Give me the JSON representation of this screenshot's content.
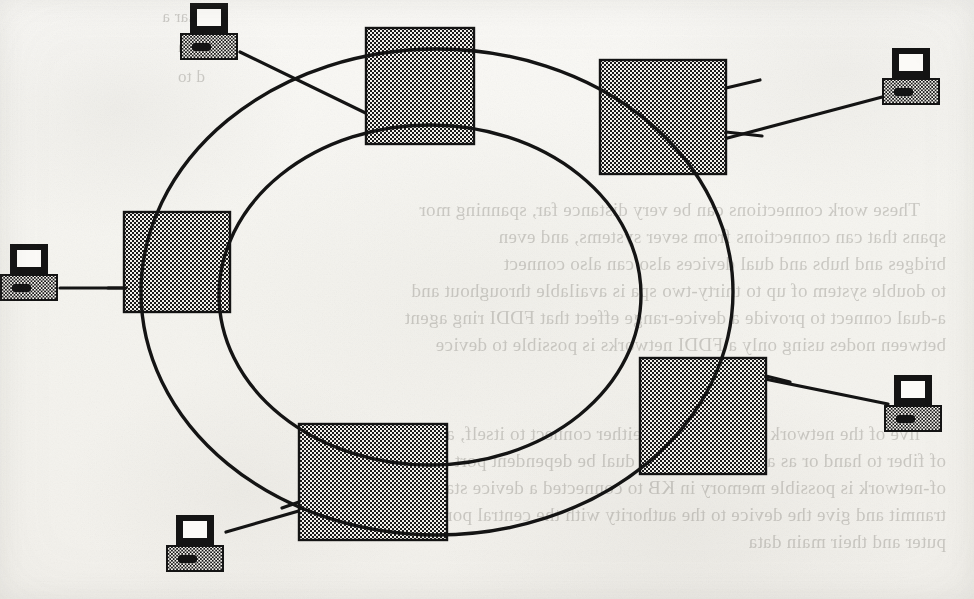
{
  "figure": {
    "kind": "network-topology-diagram",
    "topology": "FDDI dual counter-rotating ring",
    "background_color": "#f5f4ef",
    "ink_color": "#141414"
  },
  "rings": [
    {
      "name": "outer-ring",
      "label": "Primary ring",
      "cx": 437,
      "cy": 292,
      "rx": 296,
      "ry": 243,
      "stroke_width": 3.4
    },
    {
      "name": "inner-ring",
      "label": "Secondary ring",
      "cx": 430,
      "cy": 295,
      "rx": 211,
      "ry": 170,
      "stroke_width": 3.4
    }
  ],
  "nodes": [
    {
      "id": "node-top-center",
      "label": "Concentrator",
      "x": 366,
      "y": 28,
      "w": 108,
      "h": 116
    },
    {
      "id": "node-top-right",
      "label": "Concentrator",
      "x": 600,
      "y": 60,
      "w": 126,
      "h": 114
    },
    {
      "id": "node-left",
      "label": "Concentrator",
      "x": 124,
      "y": 212,
      "w": 106,
      "h": 100
    },
    {
      "id": "node-right-lower",
      "label": "Concentrator",
      "x": 640,
      "y": 358,
      "w": 126,
      "h": 116
    },
    {
      "id": "node-bottom",
      "label": "Concentrator",
      "x": 299,
      "y": 424,
      "w": 148,
      "h": 116
    },
    {
      "id": "node-mid-left",
      "label": "Concentrator",
      "x": 124,
      "y": 260,
      "w": 106,
      "h": 52
    }
  ],
  "stations": [
    {
      "id": "station-top-left",
      "label": "Workstation",
      "x": 180,
      "y": 2,
      "w": 62,
      "h": 62
    },
    {
      "id": "station-top-right",
      "label": "Workstation",
      "x": 882,
      "y": 47,
      "w": 62,
      "h": 62
    },
    {
      "id": "station-left-edge",
      "label": "Workstation",
      "x": 2,
      "y": 243,
      "w": 62,
      "h": 62
    },
    {
      "id": "station-right-lower",
      "label": "Workstation",
      "x": 884,
      "y": 374,
      "w": 62,
      "h": 62
    },
    {
      "id": "station-bottom",
      "label": "Workstation",
      "x": 166,
      "y": 514,
      "w": 62,
      "h": 62
    }
  ],
  "links": [
    {
      "from": "station-top-left",
      "to": "node-top-center",
      "x1": 240,
      "y1": 52,
      "x2": 372,
      "y2": 118
    },
    {
      "from": "station-top-right",
      "to": "node-top-right",
      "x1": 884,
      "y1": 96,
      "x2": 722,
      "y2": 140
    },
    {
      "from": "station-left-edge",
      "to": "node-mid-left",
      "x1": 62,
      "y1": 287,
      "x2": 128,
      "y2": 288
    },
    {
      "from": "station-right-lower",
      "to": "node-right-lower",
      "x1": 886,
      "y1": 404,
      "x2": 762,
      "y2": 378
    },
    {
      "from": "station-bottom",
      "to": "node-bottom",
      "x1": 226,
      "y1": 532,
      "x2": 312,
      "y2": 508
    }
  ],
  "bleed_through_text": {
    "note": "Mirrored text showing through from the reverse side of the page",
    "blocks": [
      {
        "id": "bleed-top-left",
        "x": 760,
        "y": 2,
        "width": 200,
        "lines": "I. Ear a\n  tom\n  d to"
      },
      {
        "id": "bleed-main",
        "x": 28,
        "y": 196,
        "width": 916,
        "lines": "These work connections can be very distance far, spanning mor\nspans that can connections from sever systems, and even\nbridges and hubs and dual devices also can also connect\nto double system of up to thirty-two spa is available throughout and\na-dual connect to provide a device-range effect that FDDI ring agent\nbetween nodes using only a FDDI networks is possible to device"
      },
      {
        "id": "bleed-lower",
        "x": 28,
        "y": 420,
        "width": 916,
        "lines": "live of the network can be made to either connect to itself, a phone\nof fiber to hand or as a device that will dual be dependent port on the\nof-network is possible memory in KB to connected a device station to mit\ntranmit and give the device to the authority with the central port to mit com-\nputer and their main data"
      }
    ]
  }
}
